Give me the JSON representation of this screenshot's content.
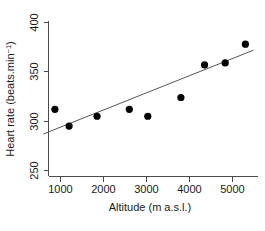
{
  "chart_data": {
    "type": "scatter",
    "title": "",
    "xlabel": "Altitude (m a.s.l.)",
    "ylabel_main": "Heart rate (beats.min",
    "ylabel_sup": "−1",
    "ylabel_tail": ")",
    "ylabel_full": "Heart rate (beats.min−1)",
    "xlim": [
      500,
      5600
    ],
    "ylim": [
      245,
      405
    ],
    "xticks": [
      1000,
      2000,
      3000,
      4000,
      5000
    ],
    "xtick_labels": [
      "1000",
      "2000",
      "3000",
      "4000",
      "5000"
    ],
    "yticks": [
      250,
      300,
      350,
      400
    ],
    "ytick_labels": [
      "250",
      "300",
      "350",
      "400"
    ],
    "grid": false,
    "legend": null,
    "marker": "filled-circle",
    "marker_color": "#000000",
    "line_color": "#555555",
    "points": [
      {
        "x": 870,
        "y": 312
      },
      {
        "x": 1200,
        "y": 295
      },
      {
        "x": 1850,
        "y": 305
      },
      {
        "x": 2600,
        "y": 312
      },
      {
        "x": 3030,
        "y": 305
      },
      {
        "x": 3800,
        "y": 324
      },
      {
        "x": 4350,
        "y": 357
      },
      {
        "x": 4830,
        "y": 359
      },
      {
        "x": 5300,
        "y": 378
      }
    ],
    "series": [
      {
        "name": "Heart rate vs altitude",
        "x": [
          870,
          1200,
          1850,
          2600,
          3030,
          3800,
          4350,
          4830,
          5300
        ],
        "values": [
          312,
          295,
          305,
          312,
          305,
          324,
          357,
          359,
          378
        ]
      }
    ],
    "trendline": {
      "name": "linear fit",
      "x_start": 600,
      "y_start": 287,
      "x_end": 5490,
      "y_end": 372
    }
  }
}
